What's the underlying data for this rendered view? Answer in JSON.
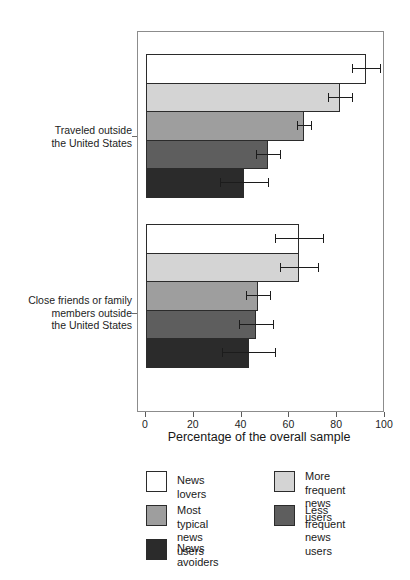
{
  "chart_data": {
    "type": "bar",
    "orientation": "horizontal",
    "title": "",
    "xlabel": "Percentage of the overall sample",
    "ylabel": "",
    "xlim": [
      0,
      100
    ],
    "xticks": [
      0,
      20,
      40,
      60,
      80,
      100
    ],
    "xticklabels": [
      "0",
      "20",
      "40",
      "60",
      "80",
      "100"
    ],
    "grid": false,
    "legend_position": "below-plot",
    "error_bars": "95% confidence interval",
    "categories": [
      "Traveled outside the United States",
      "Close friends or family members outside the United States"
    ],
    "category_label_lines": [
      [
        "Traveled outside",
        "the United States"
      ],
      [
        "Close friends or family",
        "members outside",
        "the United States"
      ]
    ],
    "series": [
      {
        "name": "News lovers",
        "color": "#ffffff",
        "values": [
          92,
          64
        ],
        "errors": [
          6,
          10
        ]
      },
      {
        "name": "More frequent news users",
        "color": "#d4d4d4",
        "values": [
          81,
          64
        ],
        "errors": [
          5,
          8
        ]
      },
      {
        "name": "Most typical news users",
        "color": "#9e9e9e",
        "values": [
          66,
          47
        ],
        "errors": [
          3,
          5
        ]
      },
      {
        "name": "Less frequent news users",
        "color": "#5e5e5e",
        "values": [
          51,
          46
        ],
        "errors": [
          5,
          7
        ]
      },
      {
        "name": "News avoiders",
        "color": "#2b2b2b",
        "values": [
          41,
          43
        ],
        "errors": [
          10,
          11
        ]
      }
    ]
  },
  "legend": {
    "left_column": [
      {
        "label": "News lovers",
        "color": "#ffffff"
      },
      {
        "label": "Most typical\nnews users",
        "color": "#9e9e9e"
      },
      {
        "label": "News avoiders",
        "color": "#2b2b2b"
      }
    ],
    "right_column": [
      {
        "label": "More frequent\nnews users",
        "color": "#d4d4d4"
      },
      {
        "label": "Less frequent\nnews users",
        "color": "#5e5e5e"
      }
    ]
  }
}
